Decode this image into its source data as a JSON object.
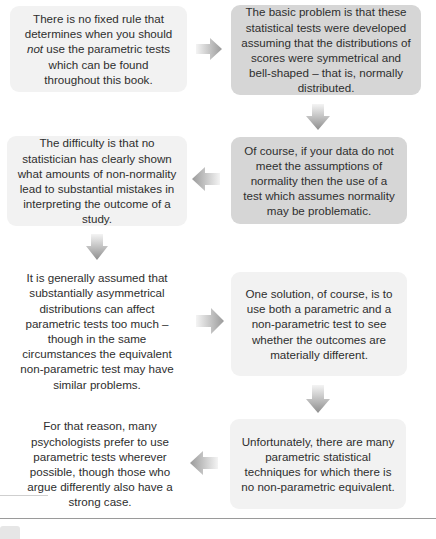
{
  "flow": {
    "boxes": [
      {
        "id": 1,
        "text_before": "There is no fixed rule that determines when you should ",
        "italic": "not",
        "text_after": " use the parametric tests which can be found throughout this book.",
        "style": "light"
      },
      {
        "id": 2,
        "text": "The basic problem is that these statistical tests were developed assuming that the distributions of scores were symmetrical and bell-shaped – that is, normally distributed.",
        "style": "dark"
      },
      {
        "id": 3,
        "text": "Of course, if your data do not meet the assumptions of normality then the use of a test which assumes normality may be problematic.",
        "style": "dark"
      },
      {
        "id": 4,
        "text": "The difficulty is that no statistician has clearly shown what amounts of non-normality lead to substantial mistakes in interpreting the outcome of a study.",
        "style": "light"
      },
      {
        "id": 5,
        "text": "It is generally assumed that substantially asymmetrical distributions can affect parametric tests too much – though in the same circumstances the equivalent non-parametric test may have similar problems.",
        "style": "plain"
      },
      {
        "id": 6,
        "text": "One solution, of course, is to use both a parametric and a non-parametric test to see whether the outcomes are materially different.",
        "style": "light"
      },
      {
        "id": 7,
        "text": "Unfortunately, there are many parametric statistical techniques for which there is no non-parametric equivalent.",
        "style": "light"
      },
      {
        "id": 8,
        "text": "For that reason, many psychologists prefer to use parametric tests wherever possible, though those who argue differently also have a strong case.",
        "style": "plain"
      }
    ],
    "arrows": [
      {
        "from": 1,
        "to": 2,
        "direction": "right"
      },
      {
        "from": 2,
        "to": 3,
        "direction": "down"
      },
      {
        "from": 3,
        "to": 4,
        "direction": "left"
      },
      {
        "from": 4,
        "to": 5,
        "direction": "down"
      },
      {
        "from": 5,
        "to": 6,
        "direction": "right"
      },
      {
        "from": 6,
        "to": 7,
        "direction": "down"
      },
      {
        "from": 7,
        "to": 8,
        "direction": "left"
      }
    ],
    "colors": {
      "light_box": "#f2f2f2",
      "dark_box": "#d6d6d6",
      "arrow": "#9e9e9e",
      "text": "#2e2e2e"
    }
  }
}
